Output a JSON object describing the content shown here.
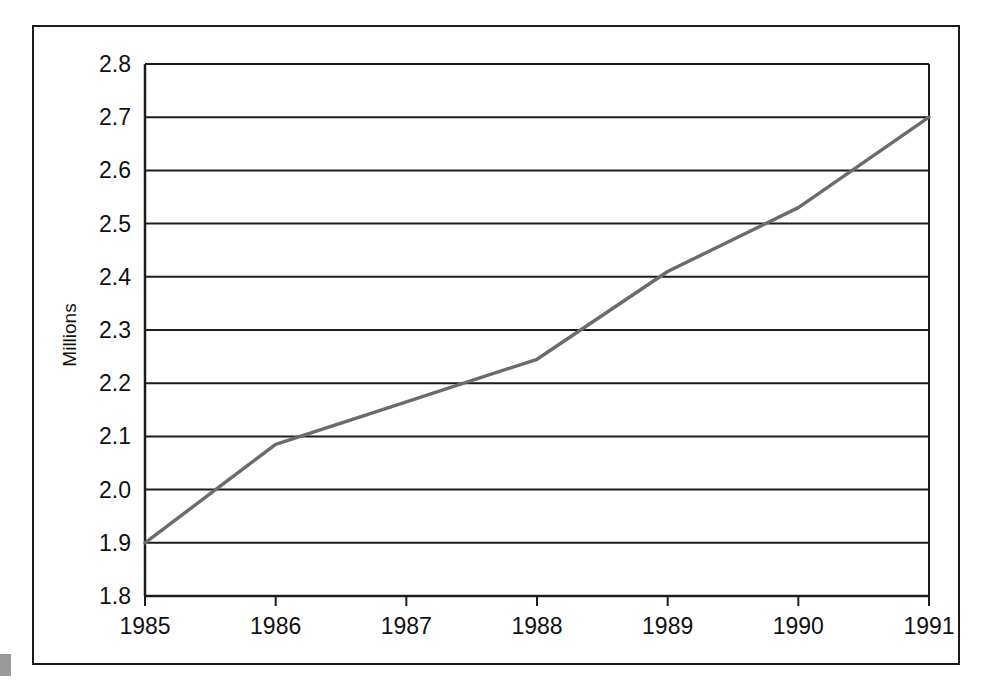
{
  "chart_data": {
    "type": "line",
    "title": "",
    "subtitle": "",
    "xlabel": "",
    "ylabel": "Millions",
    "x": [
      1985,
      1986,
      1987,
      1988,
      1989,
      1990,
      1991
    ],
    "categories": [
      "1985",
      "1986",
      "1987",
      "1988",
      "1989",
      "1990",
      "1991"
    ],
    "values": [
      1.9,
      2.085,
      2.165,
      2.245,
      2.41,
      2.53,
      2.7
    ],
    "series": [
      {
        "name": "Millions",
        "values": [
          1.9,
          2.085,
          2.165,
          2.245,
          2.41,
          2.53,
          2.7
        ]
      }
    ],
    "xlim": [
      1985,
      1991
    ],
    "ylim": [
      1.8,
      2.8
    ],
    "ytick_labels": [
      "2.8",
      "2.7",
      "2.6",
      "2.5",
      "2.4",
      "2.3",
      "2.2",
      "2.1",
      "2.0",
      "1.9",
      "1.8"
    ],
    "ytick_values": [
      2.8,
      2.7,
      2.6,
      2.5,
      2.4,
      2.3,
      2.2,
      2.1,
      2.0,
      1.9,
      1.8
    ],
    "xtick_labels": [
      "1985",
      "1986",
      "1987",
      "1988",
      "1989",
      "1990",
      "1991"
    ],
    "grid": "horizontal",
    "legend": "none",
    "legend_position": "",
    "annotations": [],
    "line_color": "#6b6b6b",
    "grid_color": "#1c1c1c",
    "axis_color": "#1c1c1c",
    "background_color": "#ffffff",
    "frame_color": "#1c1c1c"
  },
  "figure": {
    "edge_marker_color": "#9a9a9a"
  }
}
